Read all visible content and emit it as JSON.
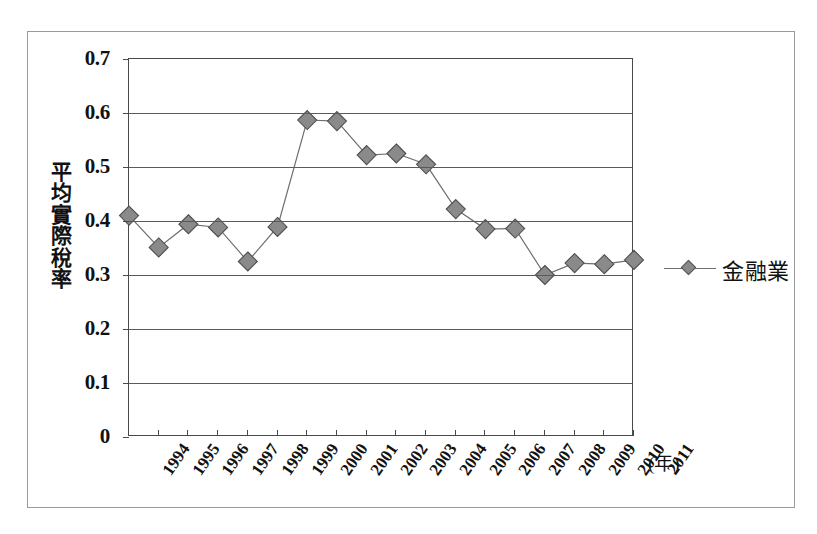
{
  "chart_data": {
    "type": "line",
    "title": "",
    "subtitle": "",
    "xlabel": "(年)",
    "ylabel": "平均實際稅率",
    "ylabel_chars": [
      "平",
      "均",
      "實",
      "際",
      "稅",
      "率"
    ],
    "categories": [
      "1994",
      "1995",
      "1996",
      "1997",
      "1998",
      "1999",
      "2000",
      "2001",
      "2002",
      "2003",
      "2004",
      "2005",
      "2006",
      "2007",
      "2008",
      "2009",
      "2010",
      "2011"
    ],
    "series": [
      {
        "name": "金融業",
        "marker": "diamond",
        "marker_color": "#8a8a8a",
        "line_color": "#6e6e6e",
        "values": [
          0.41,
          0.351,
          0.394,
          0.388,
          0.325,
          0.389,
          0.587,
          0.585,
          0.522,
          0.525,
          0.505,
          0.422,
          0.385,
          0.386,
          0.3,
          0.322,
          0.32,
          0.328
        ]
      }
    ],
    "ylim": [
      0,
      0.7
    ],
    "yticks": [
      0,
      0.1,
      0.2,
      0.3,
      0.4,
      0.5,
      0.6,
      0.7
    ],
    "ytick_labels": [
      "0",
      "0.1",
      "0.2",
      "0.3",
      "0.4",
      "0.5",
      "0.6",
      "0.7"
    ],
    "grid": "horizontal",
    "legend_position": "right",
    "legend_entries": [
      "金融業"
    ]
  },
  "legend": {
    "label": "金融業"
  },
  "axes": {
    "x_title": "(年)",
    "y_title": "平均實際稅率"
  }
}
